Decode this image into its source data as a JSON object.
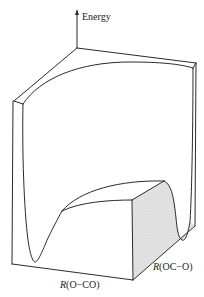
{
  "figure": {
    "type": "potential-energy-surface",
    "axes": {
      "vertical": {
        "label": "Energy"
      },
      "front": {
        "label_prefix": "R",
        "label_paren": "(O−CO)"
      },
      "side": {
        "label_prefix": "R",
        "label_paren": "(OC−O)"
      }
    },
    "colors": {
      "line": "#2a2a2a",
      "shaded_face": "#dcdcdc",
      "background": "#ffffff"
    }
  }
}
